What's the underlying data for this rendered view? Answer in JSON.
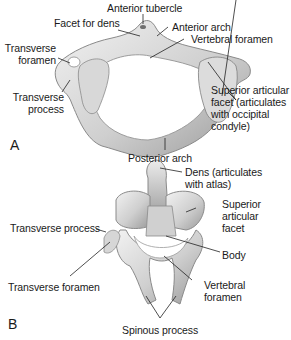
{
  "panels": [
    {
      "id": "A",
      "letter": "A",
      "labels": {
        "anterior_tubercle": "Anterior tubercle",
        "facet_for_dens": "Facet for dens",
        "anterior_arch": "Anterior arch",
        "vertebral_foramen": "Vertebral foramen",
        "transverse_foramen": "Transverse\nforamen",
        "transverse_process": "Transverse\nprocess",
        "superior_articular_facet": "Superior articular\nfacet (articulates\nwith occipital\ncondyle)",
        "posterior_arch": "Posterior arch"
      }
    },
    {
      "id": "B",
      "letter": "B",
      "labels": {
        "dens": "Dens (articulates\nwith atlas)",
        "superior_articular_facet": "Superior\narticular\nfacet",
        "transverse_process": "Transverse process",
        "body": "Body",
        "transverse_foramen": "Transverse foramen",
        "vertebral_foramen": "Vertebral\nforamen",
        "spinous_process": "Spinous process"
      }
    }
  ],
  "colors": {
    "bone_light": "#e6e6e6",
    "bone_mid": "#c4c4c4",
    "bone_dark": "#8e8e8e",
    "leader": "#222222",
    "text": "#1a1a1a"
  }
}
